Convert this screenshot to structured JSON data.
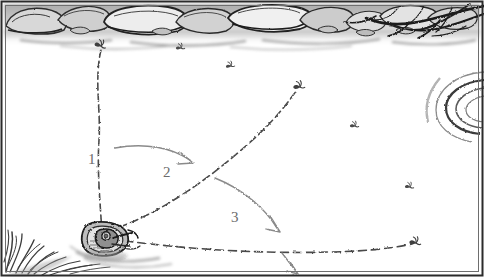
{
  "figure": {
    "scene_description": "Overhead pen-and-ink view of an angler casting a fly line three times in a fan pattern across still water toward a rocky, root-lined bank",
    "width": 484,
    "height": 277,
    "background_color": "#ffffff",
    "ink_color": "#4a4a4a",
    "label_color": "#6b6b6b",
    "border_color": "#2b2b2b"
  },
  "cast_labels": [
    {
      "id": "cast-1",
      "text": "1",
      "x": 88,
      "y": 160
    },
    {
      "id": "cast-2",
      "text": "2",
      "x": 163,
      "y": 173
    },
    {
      "id": "cast-3",
      "text": "3",
      "x": 231,
      "y": 218
    }
  ],
  "cast_lines": [
    {
      "id": "cast-line-1",
      "label": "1",
      "description": "First cast, nearly straight upstream toward the bank",
      "path": "M 102 233 C 100 200 97 170 99 140 C 101 110 94 80 101 50",
      "fly_x": 101,
      "fly_y": 44
    },
    {
      "id": "cast-line-2",
      "label": "2",
      "description": "Second cast, angled up and to the right with a gentle curve",
      "path": "M 108 231 C 160 215 215 175 258 135 C 278 116 288 102 297 90",
      "fly_x": 299,
      "fly_y": 86
    },
    {
      "id": "cast-line-3",
      "label": "3",
      "description": "Third cast, long and low, nearly horizontal to the right",
      "path": "M 112 239 C 180 249 260 254 330 252 C 375 251 398 247 412 244",
      "fly_x": 415,
      "fly_y": 243
    }
  ],
  "direction_arrows": [
    {
      "id": "arrow-1-to-2",
      "description": "Curved arrow sweeping from cast 1 toward cast 2",
      "path": "M 115 148 C 145 142 172 148 190 160",
      "tip_x": 192,
      "tip_y": 162
    },
    {
      "id": "arrow-2-to-3",
      "description": "Curved arrow sweeping from cast 2 toward cast 3",
      "path": "M 215 178 C 245 190 266 210 277 228",
      "tip_x": 279,
      "tip_y": 231
    },
    {
      "id": "arrow-3-downstream",
      "description": "Short arrow pointing down from cast 3 line",
      "path": "M 282 253 C 288 261 292 266 296 271",
      "tip_x": 297,
      "tip_y": 273
    }
  ],
  "angler": {
    "id": "angler",
    "description": "Angler in a float tube at the near bank, rod and line radiating outward",
    "x": 104,
    "y": 234
  },
  "water_insects": [
    {
      "id": "insect-1",
      "x": 179,
      "y": 47
    },
    {
      "id": "insect-2",
      "x": 228,
      "y": 65
    },
    {
      "id": "insect-3",
      "x": 352,
      "y": 125
    },
    {
      "id": "insect-4",
      "x": 407,
      "y": 186
    }
  ],
  "scenery": {
    "bank_label": "rocky bank with tree roots",
    "grass_label": "grass tuft at near shore",
    "ripple_label": "rise ring on the water"
  }
}
